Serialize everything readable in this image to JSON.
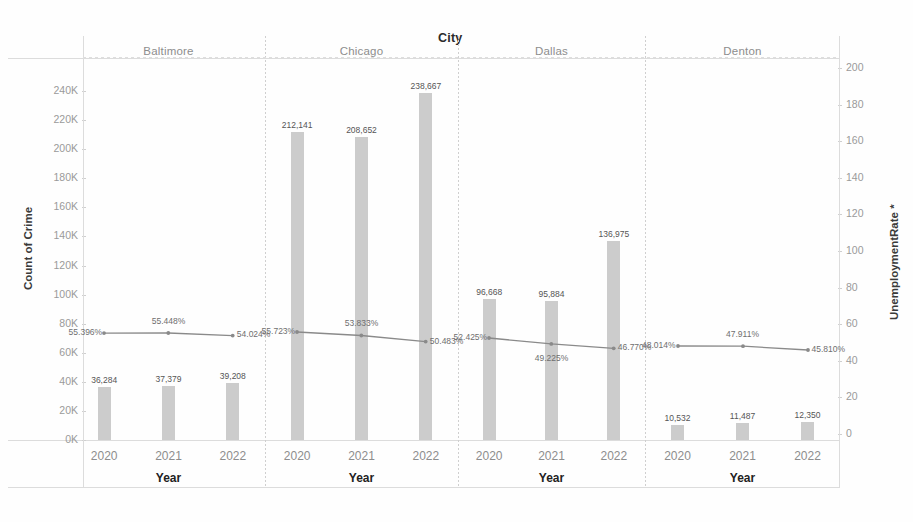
{
  "header": {
    "column_field_title": "City"
  },
  "axes": {
    "left": {
      "title": "Count of Crime",
      "ticks": [
        "0K",
        "20K",
        "40K",
        "60K",
        "80K",
        "100K",
        "120K",
        "140K",
        "160K",
        "180K",
        "200K",
        "220K",
        "240K"
      ],
      "min": 0,
      "max": 250000
    },
    "right": {
      "title": "UnemploymentRate *",
      "ticks": [
        "0",
        "20",
        "40",
        "60",
        "80",
        "100",
        "120",
        "140",
        "160",
        "180",
        "200"
      ],
      "min": 0,
      "max": 205
    },
    "bottom": {
      "title": "Year"
    }
  },
  "panels": [
    {
      "name": "Baltimore",
      "years": [
        "2020",
        "2021",
        "2022"
      ],
      "bar_labels": [
        "36,284",
        "37,379",
        "39,208"
      ],
      "bar_values": [
        36284,
        37379,
        39208
      ],
      "rate_labels": [
        "55.396%",
        "55.448%",
        "54.024%"
      ],
      "rate_values": [
        55.396,
        55.448,
        54.024
      ]
    },
    {
      "name": "Chicago",
      "years": [
        "2020",
        "2021",
        "2022"
      ],
      "bar_labels": [
        "212,141",
        "208,652",
        "238,667"
      ],
      "bar_values": [
        212141,
        208652,
        238667
      ],
      "rate_labels": [
        "55.723%",
        "53.833%",
        "50.483%"
      ],
      "rate_values": [
        55.723,
        53.833,
        50.483
      ]
    },
    {
      "name": "Dallas",
      "years": [
        "2020",
        "2021",
        "2022"
      ],
      "bar_labels": [
        "96,668",
        "95,884",
        "136,975"
      ],
      "bar_values": [
        96668,
        95884,
        136975
      ],
      "rate_labels": [
        "52.425%",
        "49.225%",
        "46.770%"
      ],
      "rate_values": [
        52.425,
        49.225,
        46.77
      ]
    },
    {
      "name": "Denton",
      "years": [
        "2020",
        "2021",
        "2022"
      ],
      "bar_labels": [
        "10,532",
        "11,487",
        "12,350"
      ],
      "bar_values": [
        10532,
        11487,
        12350
      ],
      "rate_labels": [
        "48.014%",
        "47.911%",
        "45.810%"
      ],
      "rate_values": [
        48.014,
        47.911,
        45.81
      ]
    }
  ],
  "colors": {
    "bar": "#cccccc",
    "line": "#8a8a8a",
    "grid": "#dcdcdc",
    "tick_text": "#9a9a9a"
  },
  "chart_data": {
    "type": "bar",
    "title": "City",
    "xlabel": "Year",
    "ylabel": "Count of Crime",
    "y2label": "UnemploymentRate *",
    "ylim": [
      0,
      250000
    ],
    "y2lim": [
      0,
      205
    ],
    "grid": false,
    "legend": "none",
    "facet_field": "City",
    "facets": [
      "Baltimore",
      "Chicago",
      "Dallas",
      "Denton"
    ],
    "categories": [
      "2020",
      "2021",
      "2022"
    ],
    "series": [
      {
        "name": "Count of Crime (bars)",
        "axis": "left",
        "mark": "bar",
        "data": {
          "Baltimore": [
            36284,
            37379,
            39208
          ],
          "Chicago": [
            212141,
            208652,
            238667
          ],
          "Dallas": [
            96668,
            95884,
            136975
          ],
          "Denton": [
            10532,
            11487,
            12350
          ]
        },
        "labels": {
          "Baltimore": [
            "36,284",
            "37,379",
            "39,208"
          ],
          "Chicago": [
            "212,141",
            "208,652",
            "238,667"
          ],
          "Dallas": [
            "96,668",
            "95,884",
            "136,975"
          ],
          "Denton": [
            "10,532",
            "11,487",
            "12,350"
          ]
        }
      },
      {
        "name": "UnemploymentRate * (line)",
        "axis": "right",
        "mark": "line",
        "data": {
          "Baltimore": [
            55.396,
            55.448,
            54.024
          ],
          "Chicago": [
            55.723,
            53.833,
            50.483
          ],
          "Dallas": [
            52.425,
            49.225,
            46.77
          ],
          "Denton": [
            48.014,
            47.911,
            45.81
          ]
        },
        "labels": {
          "Baltimore": [
            "55.396%",
            "55.448%",
            "54.024%"
          ],
          "Chicago": [
            "55.723%",
            "53.833%",
            "50.483%"
          ],
          "Dallas": [
            "52.425%",
            "49.225%",
            "46.770%"
          ],
          "Denton": [
            "48.014%",
            "47.911%",
            "45.810%"
          ]
        }
      }
    ],
    "yticks": [
      0,
      20000,
      40000,
      60000,
      80000,
      100000,
      120000,
      140000,
      160000,
      180000,
      200000,
      220000,
      240000
    ],
    "ytick_labels": [
      "0K",
      "20K",
      "40K",
      "60K",
      "80K",
      "100K",
      "120K",
      "140K",
      "160K",
      "180K",
      "200K",
      "220K",
      "240K"
    ],
    "y2ticks": [
      0,
      20,
      40,
      60,
      80,
      100,
      120,
      140,
      160,
      180,
      200
    ],
    "y2tick_labels": [
      "0",
      "20",
      "40",
      "60",
      "80",
      "100",
      "120",
      "140",
      "160",
      "180",
      "200"
    ]
  }
}
